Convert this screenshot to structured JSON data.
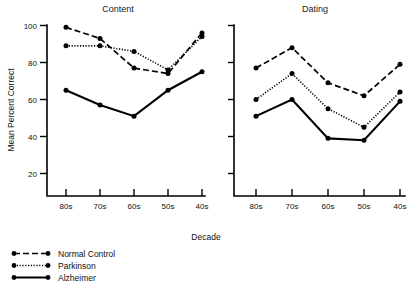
{
  "figure": {
    "y_axis_title": "Mean  Percent  Correct",
    "x_axis_title": "Decade"
  },
  "legend": {
    "items": [
      {
        "label": "Normal Control",
        "style": "dashed",
        "dash": "6,3"
      },
      {
        "label": "Parkinson",
        "style": "dotted",
        "dash": "1.2,1.6"
      },
      {
        "label": "Alzheimer",
        "style": "solid",
        "dash": ""
      }
    ]
  },
  "chart_data": [
    {
      "type": "line",
      "title": "Content",
      "xlabel": "Decade",
      "ylabel": "Mean Percent Correct",
      "categories": [
        "80s",
        "70s",
        "60s",
        "50s",
        "40s"
      ],
      "yticks": [
        20,
        40,
        60,
        80,
        100
      ],
      "ylim": [
        14,
        103
      ],
      "grid": false,
      "legend_position": "bottom-left",
      "series": [
        {
          "name": "Normal Control",
          "values": [
            99,
            93,
            77,
            74,
            96
          ]
        },
        {
          "name": "Parkinson",
          "values": [
            89,
            89,
            86,
            76,
            94
          ]
        },
        {
          "name": "Alzheimer",
          "values": [
            65,
            57,
            51,
            65,
            75
          ]
        }
      ]
    },
    {
      "type": "line",
      "title": "Dating",
      "xlabel": "Decade",
      "ylabel": "Mean Percent Correct",
      "categories": [
        "80s",
        "70s",
        "60s",
        "50s",
        "40s"
      ],
      "yticks": [
        20,
        40,
        60,
        80,
        100
      ],
      "ylim": [
        14,
        103
      ],
      "grid": false,
      "legend_position": "bottom-left",
      "series": [
        {
          "name": "Normal Control",
          "values": [
            77,
            88,
            69,
            62,
            79
          ]
        },
        {
          "name": "Parkinson",
          "values": [
            60,
            74,
            55,
            45,
            64
          ]
        },
        {
          "name": "Alzheimer",
          "values": [
            51,
            60,
            39,
            38,
            59
          ]
        }
      ]
    }
  ]
}
